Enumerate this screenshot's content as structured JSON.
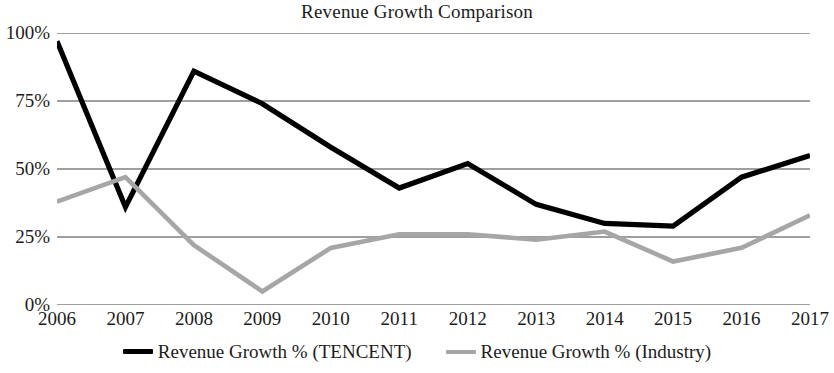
{
  "chart_data": {
    "type": "line",
    "title": "Revenue Growth Comparison",
    "xlabel": "",
    "ylabel": "",
    "categories": [
      "2006",
      "2007",
      "2008",
      "2009",
      "2010",
      "2011",
      "2012",
      "2013",
      "2014",
      "2015",
      "2016",
      "2017"
    ],
    "series": [
      {
        "name": "Revenue Growth % (TENCENT)",
        "color": "#000000",
        "values": [
          97,
          36,
          86,
          74,
          58,
          43,
          52,
          37,
          30,
          29,
          47,
          55
        ]
      },
      {
        "name": "Revenue Growth % (Industry)",
        "color": "#a6a6a6",
        "values": [
          38,
          47,
          22,
          5,
          21,
          26,
          26,
          24,
          27,
          16,
          21,
          33
        ]
      }
    ],
    "ylim": [
      0,
      100
    ],
    "y_ticks": [
      0,
      25,
      50,
      75,
      100
    ],
    "y_tick_labels": [
      "0%",
      "25%",
      "50%",
      "75%",
      "100%"
    ],
    "grid": true,
    "grid_color": "#7f7f7f",
    "legend_position": "bottom"
  },
  "legend": {
    "entries": [
      {
        "label": "Revenue Growth % (TENCENT)",
        "color": "#000000"
      },
      {
        "label": "Revenue Growth % (Industry)",
        "color": "#a6a6a6"
      }
    ]
  }
}
